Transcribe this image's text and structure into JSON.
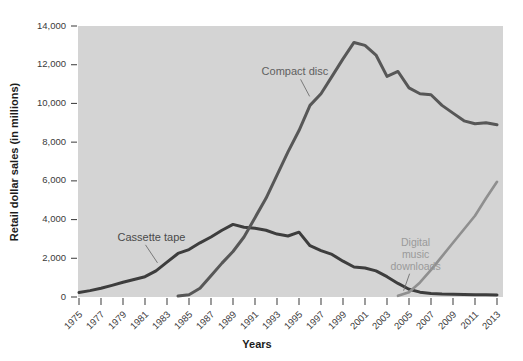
{
  "chart_data": {
    "type": "line",
    "title": "",
    "xlabel": "Years",
    "ylabel": "Retail dollar sales (in millions)",
    "xlim": [
      1975,
      2013
    ],
    "ylim": [
      0,
      14000
    ],
    "grid": false,
    "legend_position": "inline-annotations",
    "plot_background": "#d4d4d4",
    "x_tick_labels": [
      "1975",
      "1977",
      "1979",
      "1981",
      "1983",
      "1985",
      "1987",
      "1989",
      "1991",
      "1993",
      "1995",
      "1997",
      "1999",
      "2001",
      "2003",
      "2005",
      "2007",
      "2009",
      "2011",
      "2013"
    ],
    "y_tick_labels": [
      "0",
      "2,000",
      "4,000",
      "6,000",
      "8,000",
      "10,000",
      "12,000",
      "14,000"
    ],
    "y_tick_values": [
      0,
      2000,
      4000,
      6000,
      8000,
      10000,
      12000,
      14000
    ],
    "x": [
      1975,
      1976,
      1977,
      1978,
      1979,
      1980,
      1981,
      1982,
      1983,
      1984,
      1985,
      1986,
      1987,
      1988,
      1989,
      1990,
      1991,
      1992,
      1993,
      1994,
      1995,
      1996,
      1997,
      1998,
      1999,
      2000,
      2001,
      2002,
      2003,
      2004,
      2005,
      2006,
      2007,
      2008,
      2009,
      2010,
      2011,
      2012,
      2013
    ],
    "series": [
      {
        "name": "Cassette tape",
        "color": "#3d3d3d",
        "label_color": "#4a4a4a",
        "values": [
          230,
          330,
          450,
          600,
          760,
          900,
          1050,
          1350,
          1800,
          2250,
          2450,
          2800,
          3100,
          3450,
          3750,
          3600,
          3550,
          3450,
          3250,
          3150,
          3350,
          2650,
          2400,
          2200,
          1850,
          1550,
          1500,
          1350,
          1050,
          700,
          400,
          250,
          180,
          150,
          140,
          130,
          120,
          110,
          100
        ]
      },
      {
        "name": "Compact disc",
        "color": "#575757",
        "label_color": "#606060",
        "values": [
          null,
          null,
          null,
          null,
          null,
          null,
          null,
          null,
          null,
          50,
          120,
          450,
          1100,
          1750,
          2350,
          3100,
          4100,
          5100,
          6300,
          7500,
          8600,
          9900,
          10500,
          11400,
          12300,
          13150,
          13000,
          12500,
          11400,
          11650,
          10800,
          10500,
          10450,
          9900,
          9500,
          9100,
          8950,
          9000,
          8900
        ]
      },
      {
        "name": "Digital music downloads",
        "color": "#8f8f8f",
        "label_color": "#9a9a9a",
        "values": [
          null,
          null,
          null,
          null,
          null,
          null,
          null,
          null,
          null,
          null,
          null,
          null,
          null,
          null,
          null,
          null,
          null,
          null,
          null,
          null,
          null,
          null,
          null,
          null,
          null,
          null,
          null,
          null,
          null,
          60,
          250,
          750,
          1400,
          2100,
          2800,
          3500,
          4200,
          5100,
          5950
        ]
      }
    ],
    "annotations": [
      {
        "text": "Cassette tape",
        "x": 1978.5,
        "y": 2900,
        "anchor": "start"
      },
      {
        "text": "Compact disc",
        "x": 1991.6,
        "y": 11450,
        "anchor": "start"
      },
      {
        "text": "Digital music downloads",
        "lines": [
          "Digital",
          "music",
          "downloads"
        ],
        "x": 2005.6,
        "y": 2650,
        "anchor": "middle"
      }
    ]
  },
  "axes": {
    "y_axis_title": "Retail dollar sales (in millions)",
    "x_axis_title": "Years"
  },
  "labels": {
    "cassette": "Cassette tape",
    "compact_disc": "Compact disc",
    "digital_1": "Digital",
    "digital_2": "music",
    "digital_3": "downloads"
  },
  "colors": {
    "panel": "#d4d4d4",
    "cassette_line": "#3d3d3d",
    "cd_line": "#575757",
    "downloads_line": "#8f8f8f",
    "text": "#3a3a3a"
  }
}
